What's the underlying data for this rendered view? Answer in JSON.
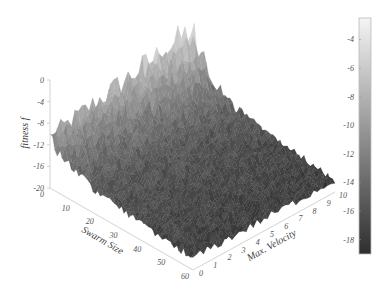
{
  "chart_data": {
    "type": "surface3d",
    "title": "",
    "xlabel": "Swarm Size",
    "ylabel": "Max. Velocity",
    "zlabel": "fitness f",
    "x_ticks": [
      0,
      10,
      20,
      30,
      40,
      50,
      60
    ],
    "y_ticks": [
      0,
      1,
      2,
      3,
      4,
      5,
      6,
      7,
      8,
      9,
      10
    ],
    "z_ticks": [
      0,
      -4,
      -8,
      -12,
      -16,
      -20
    ],
    "xlim": [
      0,
      60
    ],
    "ylim": [
      0,
      10
    ],
    "zlim": [
      -20,
      0
    ],
    "colorbar": {
      "ticks": [
        -4,
        -6,
        -8,
        -10,
        -12,
        -14,
        -16,
        -18
      ],
      "range": [
        -19,
        -2.5
      ],
      "colormap": "gray",
      "color_top": "#f4f4f4",
      "color_bottom": "#2e2e2e"
    },
    "surface_description": "Noisy fitness surface: near swarm size 0 and high velocity the fitness rises toward -2 (light spikes); over most of the domain fitness is flat and low around -16 to -18 (dark).",
    "surface_profile": {
      "x_samples": [
        0,
        2,
        5,
        10,
        20,
        30,
        40,
        50,
        60
      ],
      "base_z_at_low_velocity": [
        -11,
        -12,
        -13,
        -14.5,
        -16,
        -16.5,
        -17,
        -17.5,
        -18
      ],
      "base_z_at_high_velocity": [
        -6,
        -8,
        -10,
        -13,
        -15.5,
        -16.5,
        -17,
        -17.5,
        -18
      ],
      "noise_amplitude_at_x0": 6,
      "noise_amplitude_far": 1.5
    },
    "grid": false,
    "legend": "colorbar-right"
  },
  "labels": {
    "x_axis": "Swarm Size",
    "y_axis": "Max. Velocity",
    "z_axis": "fitness f"
  }
}
